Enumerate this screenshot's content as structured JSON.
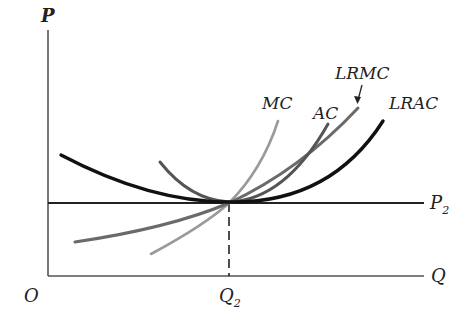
{
  "diagram": {
    "type": "economics-cost-curves",
    "axes": {
      "y_label": "P",
      "x_label": "Q",
      "origin_label": "O"
    },
    "reference": {
      "price_line": {
        "label": "P",
        "subscript": "2"
      },
      "quantity_mark": {
        "label": "Q",
        "subscript": "2"
      }
    },
    "curves": [
      {
        "id": "MC",
        "label": "MC",
        "color": "#9a9a9a",
        "shape": "upward-sloping, steepest, tangent at Q2"
      },
      {
        "id": "AC",
        "label": "AC",
        "color": "#555555",
        "shape": "U-shaped short-run, minimum at Q2"
      },
      {
        "id": "LRMC",
        "label": "LRMC",
        "color": "#6a6a6a",
        "shape": "upward-sloping, through minimum at Q2"
      },
      {
        "id": "LRAC",
        "label": "LRAC",
        "color": "#111111",
        "shape": "flat U-shaped long-run, minimum at Q2"
      }
    ],
    "annotation": {
      "arrow_target": "LRMC"
    }
  }
}
